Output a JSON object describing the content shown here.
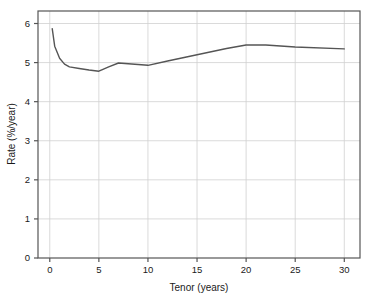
{
  "chart_data": {
    "type": "line",
    "title": "",
    "subtitle": "",
    "xlabel": "Tenor (years)",
    "ylabel": "Rate (%/year)",
    "xlim": [
      -1.2,
      31.6
    ],
    "ylim": [
      0,
      6.32
    ],
    "xticks": [
      0,
      5,
      10,
      15,
      20,
      25,
      30
    ],
    "xtick_labels": [
      "0",
      "5",
      "10",
      "15",
      "20",
      "25",
      "30"
    ],
    "yticks": [
      0,
      1,
      2,
      3,
      4,
      5,
      6
    ],
    "ytick_labels": [
      "0",
      "1",
      "2",
      "3",
      "4",
      "5",
      "6"
    ],
    "grid": true,
    "legend": false,
    "legend_position": "none",
    "annotations": [],
    "series": [
      {
        "name": "Yield curve",
        "color": "#555555",
        "line_width": 1.4,
        "marker": "none",
        "x": [
          0.25,
          0.5,
          1,
          1.5,
          2,
          3,
          4,
          5,
          6,
          7,
          8,
          9,
          10,
          12,
          15,
          18,
          20,
          22,
          25,
          30
        ],
        "y": [
          5.87,
          5.42,
          5.11,
          4.96,
          4.89,
          4.85,
          4.81,
          4.78,
          4.89,
          4.99,
          4.97,
          4.95,
          4.93,
          5.04,
          5.2,
          5.36,
          5.45,
          5.45,
          5.4,
          5.35
        ]
      }
    ]
  },
  "axes": {
    "x_axis_name": "tenor-axis",
    "y_axis_name": "rate-axis"
  },
  "style": {
    "line_color": "#555555",
    "grid_color": "#d0d0d0",
    "axis_color": "#555555",
    "text_color": "#1a1a1a",
    "background": "#ffffff"
  }
}
